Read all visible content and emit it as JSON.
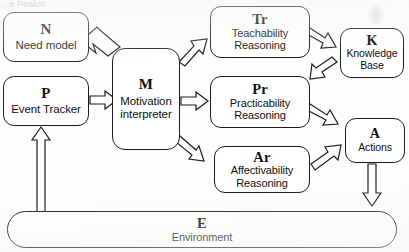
{
  "diagram": {
    "title_remnant": "...e Peakm",
    "nodes": [
      {
        "id": "need-model",
        "code": "N",
        "label": "Need model"
      },
      {
        "id": "event-tracker",
        "code": "P",
        "label": "Event Tracker"
      },
      {
        "id": "motivation",
        "code": "M",
        "label_line1": "Motivation",
        "label_line2": "interpreter"
      },
      {
        "id": "teachability",
        "code": "Tr",
        "label_line1": "Teachability",
        "label_line2": "Reasoning"
      },
      {
        "id": "practicability",
        "code": "Pr",
        "label_line1": "Practicability",
        "label_line2": "Reasoning"
      },
      {
        "id": "affectivability",
        "code": "Ar",
        "label_line1": "Affectivability",
        "label_line2": "Reasoning"
      },
      {
        "id": "knowledge-base",
        "code": "K",
        "label_line1": "Knowledge",
        "label_line2": "Base"
      },
      {
        "id": "actions",
        "code": "A",
        "label": "Actions"
      },
      {
        "id": "environment",
        "code": "E",
        "label": "Environment"
      }
    ],
    "edges": [
      {
        "from": "need-model",
        "to": "motivation",
        "style": "thick-block-arrow"
      },
      {
        "from": "event-tracker",
        "to": "motivation",
        "style": "block-arrow"
      },
      {
        "from": "motivation",
        "to": "teachability",
        "style": "block-arrow"
      },
      {
        "from": "motivation",
        "to": "practicability",
        "style": "block-arrow"
      },
      {
        "from": "motivation",
        "to": "affectivability",
        "style": "block-arrow"
      },
      {
        "from": "teachability",
        "to": "knowledge-base",
        "style": "block-arrow"
      },
      {
        "from": "knowledge-base",
        "to": "practicability",
        "style": "block-arrow"
      },
      {
        "from": "practicability",
        "to": "actions",
        "style": "block-arrow"
      },
      {
        "from": "affectivability",
        "to": "actions",
        "style": "block-arrow"
      },
      {
        "from": "actions",
        "to": "environment",
        "style": "block-arrow"
      },
      {
        "from": "environment",
        "to": "event-tracker",
        "style": "block-arrow"
      }
    ],
    "colors": {
      "stroke": "#1d1d1d",
      "fill": "#ffffff",
      "background": "#fdfdfc"
    }
  }
}
